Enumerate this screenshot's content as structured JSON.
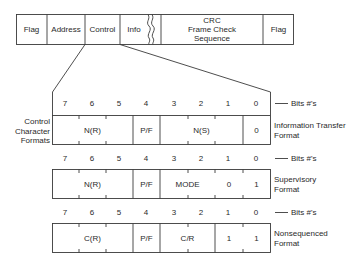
{
  "frame": {
    "fields": [
      {
        "label": "Flag"
      },
      {
        "label": "Address"
      },
      {
        "label": "Control"
      },
      {
        "label": "Info"
      },
      {
        "label_lines": [
          "CRC",
          "Frame Check",
          "Sequence"
        ]
      },
      {
        "label": "Flag"
      }
    ]
  },
  "side_label": [
    "Control",
    "Character",
    "Formats"
  ],
  "bits_label": "Bits #'s",
  "bit_numbers": [
    "7",
    "6",
    "5",
    "4",
    "3",
    "2",
    "1",
    "0"
  ],
  "formats": [
    {
      "name_lines": [
        "Information Transfer",
        "Format"
      ],
      "cells": [
        {
          "label": "N(R)",
          "bits": "7-5"
        },
        {
          "label": "P/F",
          "bits": "4"
        },
        {
          "label": "N(S)",
          "bits": "3-1"
        },
        {
          "label": "0",
          "bits": "0"
        }
      ]
    },
    {
      "name_lines": [
        "Supervisory",
        "Format"
      ],
      "cells": [
        {
          "label": "N(R)",
          "bits": "7-5"
        },
        {
          "label": "P/F",
          "bits": "4"
        },
        {
          "label": "MODE",
          "bits": "3-2"
        },
        {
          "label": "0",
          "bits": "1"
        },
        {
          "label": "1",
          "bits": "0"
        }
      ]
    },
    {
      "name_lines": [
        "Nonsequenced",
        "Format"
      ],
      "cells": [
        {
          "label": "C(R)",
          "bits": "7-5"
        },
        {
          "label": "P/F",
          "bits": "4"
        },
        {
          "label": "C/R",
          "bits": "3-2"
        },
        {
          "label": "1",
          "bits": "1"
        },
        {
          "label": "1",
          "bits": "0"
        }
      ]
    }
  ],
  "colors": {
    "line": "#3a3a3a",
    "text": "#2a2a2a",
    "background": "#ffffff"
  }
}
